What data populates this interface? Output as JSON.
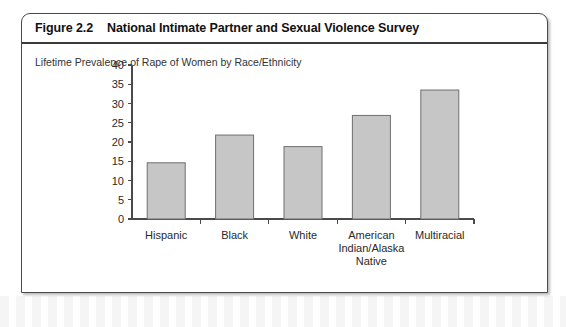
{
  "figure": {
    "number": "Figure 2.2",
    "title": "National Intimate Partner and Sexual Violence Survey"
  },
  "chart_data": {
    "type": "bar",
    "title": "Lifetime Prevalence of Rape of Women by Race/Ethnicity",
    "xlabel": "",
    "ylabel": "",
    "categories": [
      "Hispanic",
      "Black",
      "White",
      "American Indian/Alaska Native",
      "Multiracial"
    ],
    "category_lines": [
      [
        "Hispanic"
      ],
      [
        "Black"
      ],
      [
        "White"
      ],
      [
        "American",
        "Indian/Alaska",
        "Native"
      ],
      [
        "Multiracial"
      ]
    ],
    "values": [
      14.6,
      21.8,
      18.8,
      26.9,
      33.5
    ],
    "ylim": [
      0,
      40
    ],
    "yticks": [
      0,
      5,
      10,
      15,
      20,
      25,
      30,
      35,
      40
    ],
    "ytick_labels": [
      "0",
      "5",
      "10",
      "15",
      "20",
      "25",
      "30",
      "35",
      "40"
    ],
    "grid": false,
    "legend": null,
    "bar_color": "#c6c6c6",
    "bar_edge_color": "#6f6f6f",
    "axis_color": "#4a4a4a"
  }
}
